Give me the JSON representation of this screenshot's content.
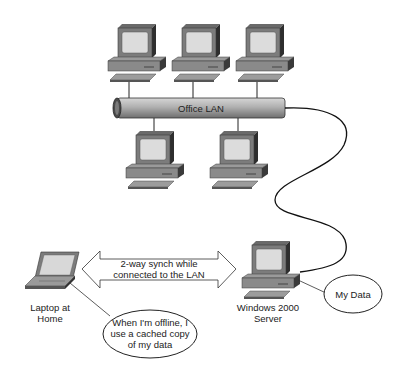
{
  "diagram": {
    "network": {
      "label": "Office LAN"
    },
    "workstations": [
      {
        "id": "pc-top-1"
      },
      {
        "id": "pc-top-2"
      },
      {
        "id": "pc-top-3"
      },
      {
        "id": "pc-bottom-1"
      },
      {
        "id": "pc-bottom-2"
      }
    ],
    "laptop": {
      "label_line1": "Laptop at",
      "label_line2": "Home"
    },
    "server": {
      "label_line1": "Windows 2000",
      "label_line2": "Server"
    },
    "sync_arrow": {
      "label_line1": "2-way synch while",
      "label_line2": "connected to the LAN"
    },
    "callouts": {
      "offline": {
        "line1": "When I'm offline, I",
        "line2": "use a cached copy",
        "line3": "of my data"
      },
      "my_data": {
        "text": "My Data"
      }
    },
    "colors": {
      "device_body": "#8a8a8a",
      "device_dark": "#3a3a3a",
      "screen": "#d8d8d8",
      "lan_pipe": "#a8a8a8",
      "line": "#222222"
    }
  }
}
